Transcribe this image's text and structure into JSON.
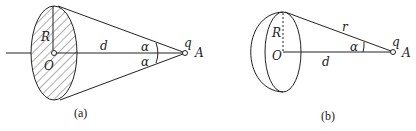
{
  "figure_a": {
    "caption": "(a)",
    "labels": {
      "R": "R",
      "O": "O",
      "d": "d",
      "alpha_top": "α",
      "alpha_bottom": "α",
      "q": "q",
      "A": "A"
    },
    "description": "Uniformly charged disk of radius R centered at O viewed in perspective; cone lines from disk rim to point charge q at A on axis, distance d, half-angle α"
  },
  "figure_b": {
    "caption": "(b)",
    "labels": {
      "R": "R",
      "O": "O",
      "r": "r",
      "d": "d",
      "alpha": "α",
      "q": "q",
      "A": "A"
    },
    "description": "Disk (thick ring edge) of radius R centered at O; line r from rim top to point charge q at A, axis distance d, angle α"
  },
  "colors": {
    "stroke": "#222222",
    "background": "#ffffff"
  }
}
